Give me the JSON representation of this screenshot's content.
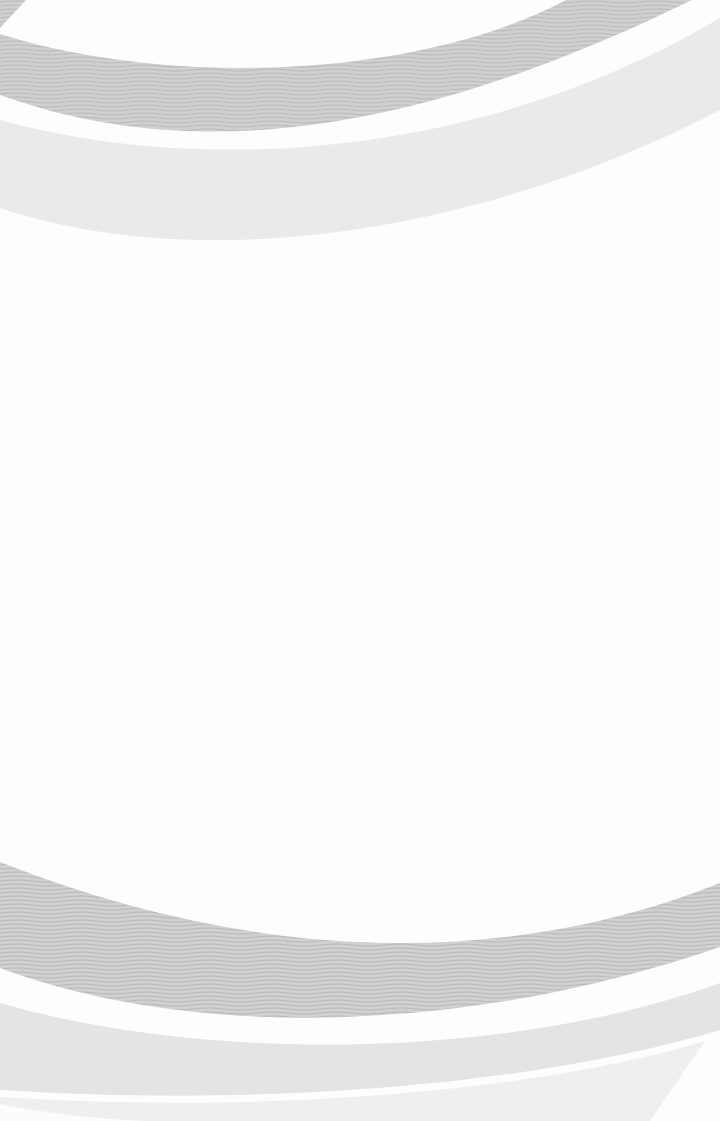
{
  "page": {
    "background_color": "#fdfdfd",
    "text_content": ""
  },
  "colors": {
    "texture_base": "#cfd0cf",
    "texture_line": "#b7bab9",
    "top_light_band": "#e9eae9",
    "bottom_light_band": "#e3e5e4",
    "bottom_footer_band": "#eef0ee",
    "gap_white": "#fdfdfd",
    "corner_wedge": "#fcfcfc"
  }
}
